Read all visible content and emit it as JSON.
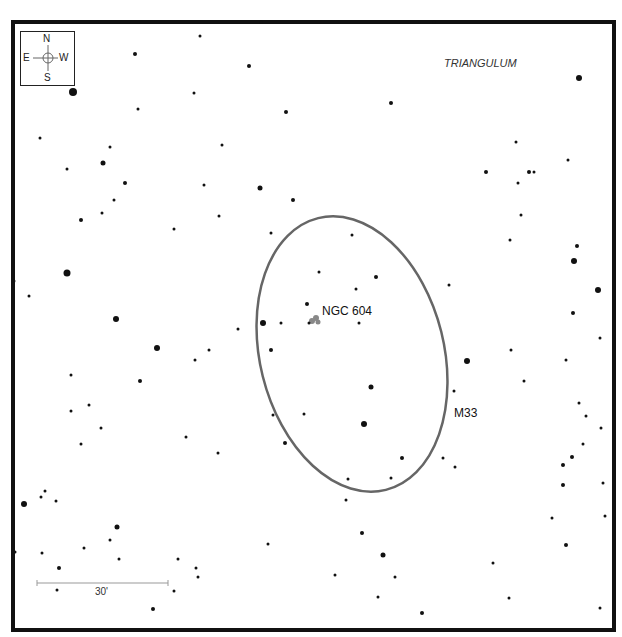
{
  "map": {
    "constellation": "TRIANGULUM",
    "compass": {
      "n": "N",
      "s": "S",
      "e": "E",
      "w": "W"
    },
    "objects": [
      {
        "name": "M33",
        "type": "galaxy-outline",
        "label_x": 454,
        "label_y": 406
      },
      {
        "name": "NGC 604",
        "type": "nebula",
        "label_x": 322,
        "label_y": 304
      }
    ],
    "scale_bar": {
      "label": "30'",
      "x1": 37,
      "x2": 168,
      "y": 583
    },
    "ellipse": {
      "cx": 352,
      "cy": 354,
      "rx": 92,
      "ry": 140,
      "rotate": -14,
      "color": "#666666"
    },
    "nebula_color": "#888888",
    "stars": [
      [
        73,
        92,
        4
      ],
      [
        135,
        54,
        2
      ],
      [
        200,
        36,
        1.5
      ],
      [
        249,
        66,
        2
      ],
      [
        261,
        22,
        1.5
      ],
      [
        286,
        112,
        2
      ],
      [
        391,
        103,
        2
      ],
      [
        434,
        22,
        1.5
      ],
      [
        579,
        78,
        3
      ],
      [
        40,
        138,
        1.5
      ],
      [
        103,
        163,
        2.5
      ],
      [
        110,
        147,
        1.5
      ],
      [
        67,
        169,
        1.5
      ],
      [
        125,
        183,
        2
      ],
      [
        138,
        109,
        1.5
      ],
      [
        194,
        93,
        1.5
      ],
      [
        222,
        145,
        1.5
      ],
      [
        260,
        188,
        2.5
      ],
      [
        204,
        185,
        1.5
      ],
      [
        293,
        200,
        2
      ],
      [
        219,
        216,
        1.5
      ],
      [
        174,
        229,
        1.5
      ],
      [
        81,
        220,
        2
      ],
      [
        114,
        200,
        1.5
      ],
      [
        102,
        213,
        1.5
      ],
      [
        67,
        273,
        3.5
      ],
      [
        14,
        281,
        1.5
      ],
      [
        29,
        296,
        1.5
      ],
      [
        116,
        319,
        3
      ],
      [
        157,
        348,
        3
      ],
      [
        140,
        381,
        2
      ],
      [
        195,
        360,
        1.5
      ],
      [
        209,
        350,
        1.5
      ],
      [
        238,
        329,
        1.5
      ],
      [
        263,
        323,
        3
      ],
      [
        281,
        323,
        1.5
      ],
      [
        271,
        350,
        2
      ],
      [
        307,
        304,
        2
      ],
      [
        309,
        323,
        1.5
      ],
      [
        319,
        272,
        1.5
      ],
      [
        352,
        235,
        1.5
      ],
      [
        376,
        277,
        2
      ],
      [
        356,
        289,
        1.5
      ],
      [
        359,
        323,
        1.5
      ],
      [
        271,
        233,
        1.5
      ],
      [
        486,
        172,
        2
      ],
      [
        516,
        142,
        1.5
      ],
      [
        529,
        172,
        2
      ],
      [
        518,
        183,
        1.5
      ],
      [
        521,
        215,
        1.5
      ],
      [
        534,
        172,
        1.5
      ],
      [
        568,
        160,
        1.5
      ],
      [
        577,
        246,
        2
      ],
      [
        574,
        261,
        3
      ],
      [
        598,
        290,
        3
      ],
      [
        573,
        313,
        2
      ],
      [
        510,
        240,
        1.5
      ],
      [
        449,
        285,
        1.5
      ],
      [
        467,
        361,
        3
      ],
      [
        454,
        391,
        1.5
      ],
      [
        511,
        350,
        1.5
      ],
      [
        524,
        381,
        1.5
      ],
      [
        566,
        360,
        1.5
      ],
      [
        579,
        403,
        1.5
      ],
      [
        586,
        416,
        1.5
      ],
      [
        601,
        428,
        1.5
      ],
      [
        583,
        444,
        1.5
      ],
      [
        572,
        457,
        2
      ],
      [
        563,
        465,
        2
      ],
      [
        563,
        485,
        2
      ],
      [
        371,
        387,
        2.5
      ],
      [
        364,
        424,
        3
      ],
      [
        402,
        458,
        2
      ],
      [
        391,
        478,
        1.5
      ],
      [
        443,
        458,
        1.5
      ],
      [
        455,
        467,
        1.5
      ],
      [
        348,
        479,
        1.5
      ],
      [
        346,
        500,
        1.5
      ],
      [
        285,
        443,
        2
      ],
      [
        304,
        414,
        1.5
      ],
      [
        273,
        415,
        1.5
      ],
      [
        218,
        453,
        1.5
      ],
      [
        186,
        437,
        1.5
      ],
      [
        71,
        375,
        1.5
      ],
      [
        89,
        405,
        1.5
      ],
      [
        101,
        428,
        1.5
      ],
      [
        81,
        444,
        1.5
      ],
      [
        71,
        411,
        1.5
      ],
      [
        24,
        504,
        3
      ],
      [
        41,
        497,
        1.5
      ],
      [
        45,
        491,
        1.5
      ],
      [
        56,
        501,
        1.5
      ],
      [
        117,
        527,
        2.5
      ],
      [
        110,
        540,
        1.5
      ],
      [
        84,
        548,
        1.5
      ],
      [
        59,
        568,
        2
      ],
      [
        42,
        553,
        1.5
      ],
      [
        15,
        552,
        1.5
      ],
      [
        57,
        590,
        1.5
      ],
      [
        119,
        559,
        1.5
      ],
      [
        178,
        559,
        1.5
      ],
      [
        196,
        568,
        1.5
      ],
      [
        198,
        577,
        1.5
      ],
      [
        174,
        591,
        1.5
      ],
      [
        153,
        609,
        2
      ],
      [
        268,
        544,
        1.5
      ],
      [
        335,
        575,
        1.5
      ],
      [
        362,
        533,
        2
      ],
      [
        383,
        555,
        2.5
      ],
      [
        395,
        577,
        1.5
      ],
      [
        422,
        613,
        2
      ],
      [
        378,
        597,
        1.5
      ],
      [
        493,
        563,
        1.5
      ],
      [
        509,
        598,
        1.5
      ],
      [
        552,
        518,
        1.5
      ],
      [
        566,
        545,
        2
      ],
      [
        600,
        608,
        1.5
      ],
      [
        605,
        516,
        1.5
      ],
      [
        600,
        338,
        1.5
      ],
      [
        603,
        483,
        1.5
      ]
    ]
  }
}
